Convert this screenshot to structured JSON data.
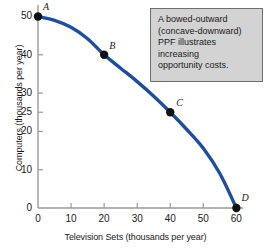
{
  "chart_data": {
    "type": "line",
    "title": "",
    "xlabel": "Television Sets (thousands per year)",
    "ylabel": "Computers (thousands per year)",
    "xlim": [
      0,
      62
    ],
    "ylim": [
      0,
      53
    ],
    "xticks": [
      0,
      10,
      20,
      30,
      40,
      50,
      60
    ],
    "xtick_labels": [
      "0",
      "10",
      "20",
      "30",
      "40",
      "50",
      "60"
    ],
    "yticks": [
      0,
      10,
      20,
      25,
      30,
      40,
      50
    ],
    "ytick_labels": [
      "0",
      "10",
      "20",
      "25",
      "30",
      "40",
      "50"
    ],
    "grid": false,
    "legend": "none",
    "series": [
      {
        "name": "Production Possibilities Frontier",
        "color": "#1F4E9C",
        "x": [
          0,
          5,
          10,
          15,
          20,
          25,
          30,
          35,
          40,
          45,
          50,
          55,
          60
        ],
        "y": [
          50,
          49.0,
          47.2,
          44.2,
          40.0,
          36.5,
          33.0,
          29.2,
          25.0,
          20.5,
          15.6,
          9.0,
          0
        ]
      }
    ],
    "points": [
      {
        "label": "A",
        "x": 0,
        "y": 50
      },
      {
        "label": "B",
        "x": 20,
        "y": 40
      },
      {
        "label": "C",
        "x": 40,
        "y": 25
      },
      {
        "label": "D",
        "x": 60,
        "y": 0
      }
    ],
    "annotation": "A bowed-outward\n(concave-downward)\nPPF illustrates\nincreasing\nopportunity costs.",
    "curve_color": "#1F4E9C",
    "point_color": "#111111",
    "axis_color": "#9a9a9a",
    "text_color": "#1a1a1a",
    "annotation_bg": "#d3d3d3",
    "annotation_border": "#6e6e6e"
  }
}
